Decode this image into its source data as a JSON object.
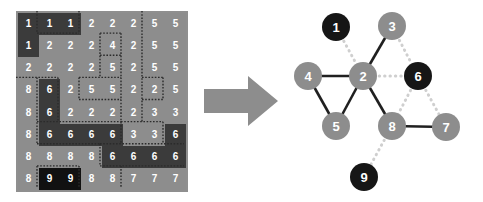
{
  "figure": {
    "left_panel_name": "labeled-pixel-grid",
    "right_panel_name": "region-adjacency-graph",
    "arrow_label": "transforms-to"
  },
  "colors": {
    "grid_light": "#8d8d8d",
    "grid_dark": "#3b3b3b",
    "grid_black": "#111111",
    "grid_border": "#5a5a5a",
    "grid_text": "#ffffff",
    "region_boundary": "#2b2b2b",
    "arrow": "#8d8d8d",
    "node_gray": "#8d8d8d",
    "node_black": "#161616",
    "edge_solid": "#202020",
    "edge_dotted": "#cfcfcf",
    "node_text": "#ffffff"
  },
  "grid": {
    "rows": 8,
    "cols": 8,
    "cell_width": 21,
    "cell_height": 22.125,
    "values": [
      [
        1,
        1,
        1,
        2,
        2,
        2,
        5,
        5
      ],
      [
        1,
        2,
        2,
        2,
        4,
        2,
        5,
        5
      ],
      [
        2,
        2,
        2,
        2,
        5,
        2,
        5,
        5
      ],
      [
        8,
        6,
        2,
        5,
        5,
        2,
        2,
        5
      ],
      [
        8,
        6,
        2,
        2,
        2,
        2,
        3,
        3
      ],
      [
        8,
        6,
        6,
        6,
        6,
        3,
        3,
        6
      ],
      [
        8,
        8,
        8,
        8,
        6,
        6,
        6,
        6
      ],
      [
        8,
        9,
        9,
        8,
        8,
        7,
        7,
        7
      ]
    ],
    "shades": [
      [
        "dark",
        "dark",
        "dark",
        "light",
        "light",
        "light",
        "light",
        "light"
      ],
      [
        "dark",
        "light",
        "light",
        "light",
        "light",
        "light",
        "light",
        "light"
      ],
      [
        "light",
        "light",
        "light",
        "light",
        "light",
        "light",
        "light",
        "light"
      ],
      [
        "light",
        "dark",
        "light",
        "light",
        "light",
        "light",
        "light",
        "light"
      ],
      [
        "light",
        "dark",
        "light",
        "light",
        "light",
        "light",
        "light",
        "light"
      ],
      [
        "light",
        "dark",
        "dark",
        "dark",
        "dark",
        "light",
        "light",
        "dark"
      ],
      [
        "light",
        "light",
        "light",
        "light",
        "dark",
        "dark",
        "dark",
        "dark"
      ],
      [
        "light",
        "black",
        "black",
        "light",
        "light",
        "light",
        "light",
        "light"
      ]
    ]
  },
  "graph": {
    "nodes": [
      {
        "id": "1",
        "label": "1",
        "cx": 48,
        "cy": 27,
        "r": 14,
        "fill": "node_black"
      },
      {
        "id": "3",
        "label": "3",
        "cx": 104,
        "cy": 26,
        "r": 14,
        "fill": "node_gray"
      },
      {
        "id": "4",
        "label": "4",
        "cx": 20,
        "cy": 76,
        "r": 14,
        "fill": "node_gray"
      },
      {
        "id": "2",
        "label": "2",
        "cx": 75,
        "cy": 76,
        "r": 14,
        "fill": "node_gray"
      },
      {
        "id": "6",
        "label": "6",
        "cx": 130,
        "cy": 76,
        "r": 14,
        "fill": "node_black"
      },
      {
        "id": "5",
        "label": "5",
        "cx": 48,
        "cy": 126,
        "r": 14,
        "fill": "node_gray"
      },
      {
        "id": "8",
        "label": "8",
        "cx": 104,
        "cy": 126,
        "r": 14,
        "fill": "node_gray"
      },
      {
        "id": "7",
        "label": "7",
        "cx": 158,
        "cy": 127,
        "r": 14,
        "fill": "node_gray"
      },
      {
        "id": "9",
        "label": "9",
        "cx": 76,
        "cy": 177,
        "r": 14,
        "fill": "node_black"
      }
    ],
    "edges": [
      {
        "from": "1",
        "to": "2",
        "style": "dotted"
      },
      {
        "from": "3",
        "to": "2",
        "style": "solid"
      },
      {
        "from": "3",
        "to": "6",
        "style": "dotted"
      },
      {
        "from": "4",
        "to": "2",
        "style": "solid"
      },
      {
        "from": "4",
        "to": "5",
        "style": "solid"
      },
      {
        "from": "2",
        "to": "5",
        "style": "solid"
      },
      {
        "from": "2",
        "to": "6",
        "style": "dotted"
      },
      {
        "from": "2",
        "to": "8",
        "style": "solid"
      },
      {
        "from": "6",
        "to": "8",
        "style": "dotted"
      },
      {
        "from": "6",
        "to": "7",
        "style": "dotted"
      },
      {
        "from": "8",
        "to": "7",
        "style": "solid"
      },
      {
        "from": "8",
        "to": "9",
        "style": "dotted"
      }
    ]
  },
  "region_boundaries": {
    "comment": "dotted segments separating labeled regions, in grid cell units",
    "horizontal": [
      {
        "row": 1,
        "c0": 1,
        "c1": 3
      },
      {
        "row": 1,
        "c0": 4,
        "c1": 5
      },
      {
        "row": 2,
        "c0": 4,
        "c1": 5
      },
      {
        "row": 3,
        "c0": 0,
        "c1": 2
      },
      {
        "row": 3,
        "c0": 3,
        "c1": 5
      },
      {
        "row": 3,
        "c0": 6,
        "c1": 7
      },
      {
        "row": 4,
        "c0": 3,
        "c1": 5
      },
      {
        "row": 4,
        "c0": 6,
        "c1": 7
      },
      {
        "row": 5,
        "c0": 1,
        "c1": 5
      },
      {
        "row": 5,
        "c0": 5,
        "c1": 7
      },
      {
        "row": 6,
        "c0": 1,
        "c1": 4
      },
      {
        "row": 6,
        "c0": 4,
        "c1": 8
      },
      {
        "row": 7,
        "c0": 1,
        "c1": 3
      },
      {
        "row": 7,
        "c0": 4,
        "c1": 8
      }
    ],
    "vertical": [
      {
        "col": 1,
        "r0": 0,
        "r1": 1
      },
      {
        "col": 3,
        "r0": 0,
        "r1": 1
      },
      {
        "col": 6,
        "r0": 0,
        "r1": 5
      },
      {
        "col": 4,
        "r0": 1,
        "r1": 3
      },
      {
        "col": 5,
        "r0": 1,
        "r1": 3
      },
      {
        "col": 1,
        "r0": 3,
        "r1": 6
      },
      {
        "col": 2,
        "r0": 3,
        "r1": 5
      },
      {
        "col": 3,
        "r0": 3,
        "r1": 4
      },
      {
        "col": 5,
        "r0": 3,
        "r1": 4
      },
      {
        "col": 7,
        "r0": 3,
        "r1": 4
      },
      {
        "col": 5,
        "r0": 4,
        "r1": 6
      },
      {
        "col": 7,
        "r0": 5,
        "r1": 6
      },
      {
        "col": 4,
        "r0": 6,
        "r1": 7
      },
      {
        "col": 1,
        "r0": 7,
        "r1": 8
      },
      {
        "col": 3,
        "r0": 7,
        "r1": 8
      },
      {
        "col": 5,
        "r0": 7,
        "r1": 8
      }
    ]
  }
}
